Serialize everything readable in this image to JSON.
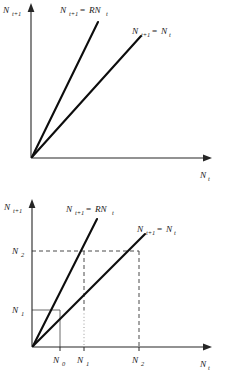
{
  "figure": {
    "type": "diagram",
    "background_color": "#ffffff",
    "line_color": "#0d0d0d",
    "axis_color": "#262626"
  },
  "panels": [
    {
      "id": "top",
      "y_axis_label": "N",
      "y_axis_sub": "t+1",
      "x_axis_label": "N",
      "x_axis_sub": "t",
      "curves": [
        {
          "name": "geometric-growth-line",
          "label_lhs": "N",
          "label_lhs_sub": "t+1",
          "label_eq": "=",
          "label_rhs": "RN",
          "label_rhs_sub": "t",
          "slope_relative": "steep"
        },
        {
          "name": "replacement-line",
          "label_lhs": "N",
          "label_lhs_sub": "t+1",
          "label_eq": "=",
          "label_rhs": "N",
          "label_rhs_sub": "t",
          "slope_relative": "unity"
        }
      ],
      "ticks": {
        "x": [],
        "y": []
      }
    },
    {
      "id": "bottom",
      "y_axis_label": "N",
      "y_axis_sub": "t+1",
      "x_axis_label": "N",
      "x_axis_sub": "t",
      "curves": [
        {
          "name": "geometric-growth-line",
          "label_lhs": "N",
          "label_lhs_sub": "t+1",
          "label_eq": "=",
          "label_rhs": "RN",
          "label_rhs_sub": "t",
          "slope_relative": "steep"
        },
        {
          "name": "replacement-line",
          "label_lhs": "N",
          "label_lhs_sub": "t+1",
          "label_eq": "=",
          "label_rhs": "N",
          "label_rhs_sub": "t",
          "slope_relative": "unity"
        }
      ],
      "ticks": {
        "x": [
          {
            "label": "N",
            "sub": "0"
          },
          {
            "label": "N",
            "sub": "1"
          },
          {
            "label": "N",
            "sub": "2"
          }
        ],
        "y": [
          {
            "label": "N",
            "sub": "2"
          },
          {
            "label": "N",
            "sub": "1"
          }
        ]
      },
      "guides": [
        {
          "name": "n1-horizontal-guide",
          "style": "solid"
        },
        {
          "name": "n0-vertical-guide",
          "style": "solid"
        },
        {
          "name": "n2-horizontal-guide",
          "style": "dashed"
        },
        {
          "name": "n1-vertical-guide-upper",
          "style": "dashed"
        },
        {
          "name": "n1-vertical-guide-lower",
          "style": "dotted"
        },
        {
          "name": "n2-vertical-guide",
          "style": "dashed"
        }
      ]
    }
  ]
}
